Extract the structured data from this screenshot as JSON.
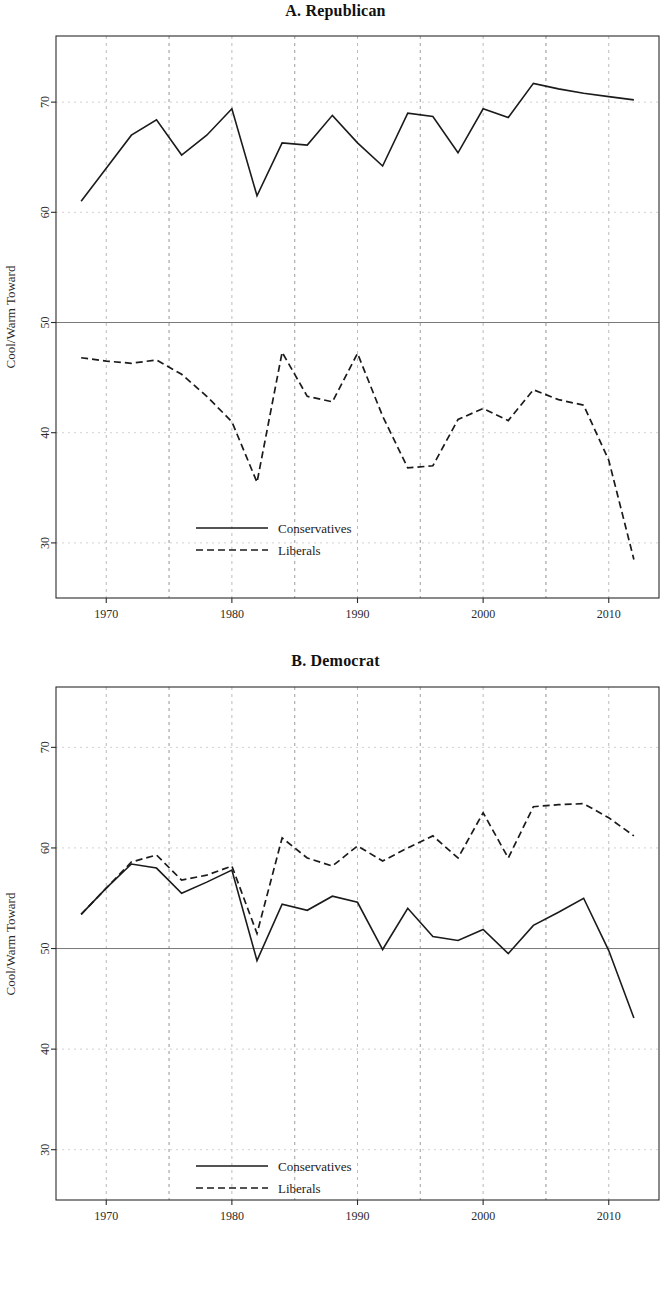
{
  "figure": {
    "background": "#ffffff",
    "line_color": "#1b1b1b"
  },
  "panels": [
    {
      "id": "A",
      "title": "A. Republican",
      "ylabel": "Cool/Warm Toward",
      "legend": {
        "conservatives": "Conservatives",
        "liberals": "Liberals"
      },
      "xticks": [
        "1970",
        "1980",
        "1990",
        "2000",
        "2010"
      ],
      "yticks": [
        "30",
        "40",
        "50",
        "60",
        "70"
      ]
    },
    {
      "id": "B",
      "title": "B. Democrat",
      "ylabel": "Cool/Warm Toward",
      "legend": {
        "conservatives": "Conservatives",
        "liberals": "Liberals"
      },
      "xticks": [
        "1970",
        "1980",
        "1990",
        "2000",
        "2010"
      ],
      "yticks": [
        "30",
        "40",
        "50",
        "60",
        "70"
      ]
    }
  ],
  "chart_data": [
    {
      "type": "line",
      "title": "A. Republican",
      "xlabel": "",
      "ylabel": "Cool/Warm Toward",
      "xlim": [
        1966,
        2014
      ],
      "ylim": [
        25,
        76
      ],
      "xticks": [
        1970,
        1980,
        1990,
        2000,
        2010
      ],
      "yticks": [
        30,
        40,
        50,
        60,
        70
      ],
      "grid": true,
      "reference_line": 50,
      "legend_position": "lower center",
      "x": [
        1968,
        1970,
        1972,
        1974,
        1976,
        1978,
        1980,
        1982,
        1984,
        1986,
        1988,
        1990,
        1992,
        1994,
        1996,
        1998,
        2000,
        2002,
        2004,
        2006,
        2008,
        2010,
        2012
      ],
      "series": [
        {
          "name": "Conservatives",
          "style": "solid",
          "values": [
            61.0,
            64.0,
            67.0,
            68.4,
            65.2,
            67.0,
            69.4,
            61.5,
            66.3,
            66.1,
            68.8,
            66.3,
            64.2,
            69.0,
            68.7,
            65.4,
            69.4,
            68.6,
            71.7,
            71.2,
            70.8,
            70.5,
            70.2
          ]
        },
        {
          "name": "Liberals",
          "style": "dashed",
          "values": [
            46.8,
            46.5,
            46.3,
            46.6,
            45.3,
            43.3,
            41.0,
            35.5,
            47.3,
            43.3,
            42.8,
            47.2,
            41.5,
            36.8,
            37.0,
            41.2,
            42.2,
            41.1,
            43.9,
            43.0,
            42.5,
            37.5,
            28.5
          ]
        }
      ]
    },
    {
      "type": "line",
      "title": "B. Democrat",
      "xlabel": "",
      "ylabel": "Cool/Warm Toward",
      "xlim": [
        1966,
        2014
      ],
      "ylim": [
        25,
        76
      ],
      "xticks": [
        1970,
        1980,
        1990,
        2000,
        2010
      ],
      "yticks": [
        30,
        40,
        50,
        60,
        70
      ],
      "grid": true,
      "reference_line": 50,
      "legend_position": "lower center",
      "x": [
        1968,
        1970,
        1972,
        1974,
        1976,
        1978,
        1980,
        1982,
        1984,
        1986,
        1988,
        1990,
        1992,
        1994,
        1996,
        1998,
        2000,
        2002,
        2004,
        2006,
        2008,
        2010,
        2012
      ],
      "series": [
        {
          "name": "Conservatives",
          "style": "solid",
          "values": [
            53.4,
            56.0,
            58.4,
            58.0,
            55.5,
            56.6,
            57.8,
            48.8,
            54.4,
            53.8,
            55.2,
            54.6,
            49.9,
            54.0,
            51.2,
            50.8,
            51.9,
            49.5,
            52.3,
            53.6,
            55.0,
            49.8,
            43.1
          ]
        },
        {
          "name": "Liberals",
          "style": "dashed",
          "values": [
            53.4,
            56.0,
            58.6,
            59.3,
            56.8,
            57.3,
            58.2,
            51.5,
            61.0,
            59.0,
            58.2,
            60.2,
            58.7,
            60.0,
            61.2,
            59.0,
            63.5,
            59.0,
            64.1,
            64.3,
            64.4,
            63.0,
            61.2
          ]
        }
      ]
    }
  ]
}
